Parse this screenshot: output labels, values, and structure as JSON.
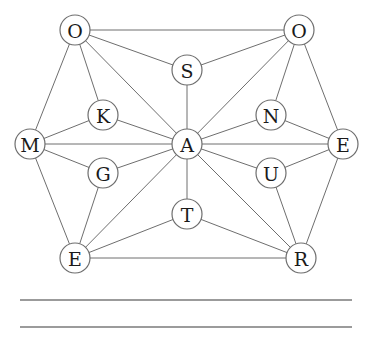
{
  "puzzle": {
    "nodes": [
      {
        "id": "o1",
        "label": "O"
      },
      {
        "id": "o2",
        "label": "O"
      },
      {
        "id": "s",
        "label": "S"
      },
      {
        "id": "k",
        "label": "K"
      },
      {
        "id": "n",
        "label": "N"
      },
      {
        "id": "m",
        "label": "M"
      },
      {
        "id": "a",
        "label": "A"
      },
      {
        "id": "e2",
        "label": "E"
      },
      {
        "id": "g",
        "label": "G"
      },
      {
        "id": "u",
        "label": "U"
      },
      {
        "id": "t",
        "label": "T"
      },
      {
        "id": "e1",
        "label": "E"
      },
      {
        "id": "r",
        "label": "R"
      }
    ],
    "edges": [
      [
        "o1",
        "o2"
      ],
      [
        "o1",
        "s"
      ],
      [
        "o1",
        "k"
      ],
      [
        "o1",
        "a"
      ],
      [
        "o1",
        "m"
      ],
      [
        "o2",
        "s"
      ],
      [
        "o2",
        "n"
      ],
      [
        "o2",
        "a"
      ],
      [
        "o2",
        "e2"
      ],
      [
        "s",
        "a"
      ],
      [
        "k",
        "m"
      ],
      [
        "k",
        "a"
      ],
      [
        "n",
        "a"
      ],
      [
        "n",
        "e2"
      ],
      [
        "m",
        "a"
      ],
      [
        "m",
        "g"
      ],
      [
        "m",
        "e1"
      ],
      [
        "e2",
        "a"
      ],
      [
        "e2",
        "u"
      ],
      [
        "e2",
        "r"
      ],
      [
        "g",
        "a"
      ],
      [
        "g",
        "e1"
      ],
      [
        "u",
        "a"
      ],
      [
        "u",
        "r"
      ],
      [
        "a",
        "t"
      ],
      [
        "a",
        "e1"
      ],
      [
        "a",
        "r"
      ],
      [
        "t",
        "e1"
      ],
      [
        "t",
        "r"
      ],
      [
        "e1",
        "r"
      ]
    ],
    "answer_lines": 2
  }
}
